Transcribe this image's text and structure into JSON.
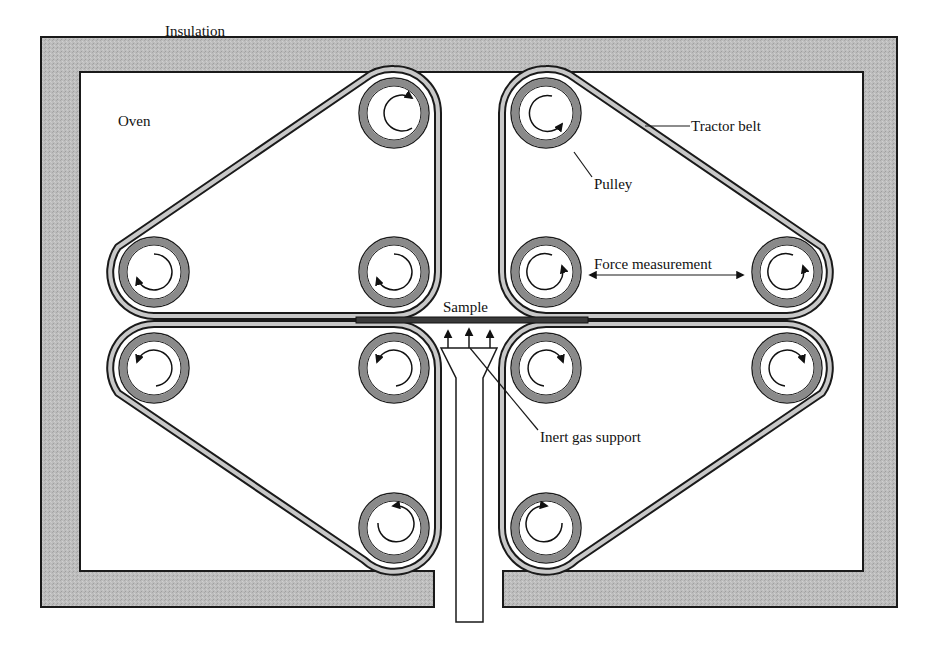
{
  "diagram": {
    "type": "schematic",
    "labels": {
      "insulation": "Insulation",
      "oven": "Oven",
      "tractor_belt": "Tractor belt",
      "pulley": "Pulley",
      "force_measurement": "Force measurement",
      "sample": "Sample",
      "inert_gas_support": "Inert gas support"
    },
    "colors": {
      "insulation_fill": "#b9b9b9",
      "outline": "#1a1a1a",
      "pulley_ring": "#8a8a8a",
      "belt_fill": "#c8c8c8",
      "sample_fill": "#3a3a3a",
      "background": "#ffffff"
    },
    "pulleys": [
      {
        "id": "top-left-top",
        "rotation": "counterclockwise"
      },
      {
        "id": "top-left-left",
        "rotation": "counterclockwise"
      },
      {
        "id": "top-left-right",
        "rotation": "counterclockwise"
      },
      {
        "id": "top-right-top",
        "rotation": "clockwise"
      },
      {
        "id": "top-right-left",
        "rotation": "counterclockwise"
      },
      {
        "id": "top-right-right",
        "rotation": "counterclockwise"
      },
      {
        "id": "bottom-left-left",
        "rotation": "counterclockwise"
      },
      {
        "id": "bottom-left-right",
        "rotation": "counterclockwise"
      },
      {
        "id": "bottom-left-bottom",
        "rotation": "counterclockwise"
      },
      {
        "id": "bottom-right-left",
        "rotation": "clockwise"
      },
      {
        "id": "bottom-right-right",
        "rotation": "clockwise"
      },
      {
        "id": "bottom-right-bottom",
        "rotation": "clockwise"
      }
    ],
    "gas_arrows_count": 3
  }
}
